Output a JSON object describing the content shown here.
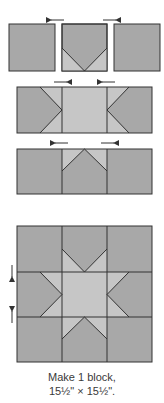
{
  "colors": {
    "dark_fabric": "#a8a8a8",
    "light_fabric": "#c6c6c6",
    "seam": "#333333",
    "arrow": "#333333",
    "background": "#ffffff"
  },
  "steps": [
    {
      "name": "row-1-units",
      "units": [
        "plain-square",
        "flying-geese-down",
        "plain-square"
      ],
      "press_arrows": [
        {
          "direction": "left",
          "position": "above-left-seam"
        },
        {
          "direction": "right",
          "position": "above-right-seam"
        }
      ]
    },
    {
      "name": "row-2-units",
      "units": [
        "flying-geese-right",
        "center-square",
        "flying-geese-left"
      ],
      "press_arrows": [
        {
          "direction": "right",
          "position": "above-left-seam"
        },
        {
          "direction": "left",
          "position": "above-right-seam"
        }
      ]
    },
    {
      "name": "row-3-units",
      "units": [
        "plain-square",
        "flying-geese-up",
        "plain-square"
      ],
      "press_arrows": [
        {
          "direction": "left",
          "position": "above-left-seam"
        },
        {
          "direction": "right",
          "position": "above-right-seam"
        }
      ]
    },
    {
      "name": "finished-block",
      "grid": "3x3",
      "press_arrows": [
        {
          "direction": "down",
          "position": "left-of-top-seam"
        },
        {
          "direction": "up",
          "position": "left-of-bottom-seam"
        }
      ]
    }
  ],
  "caption": {
    "line1": "Make 1 block,",
    "line2": "15½\" × 15½\"."
  }
}
